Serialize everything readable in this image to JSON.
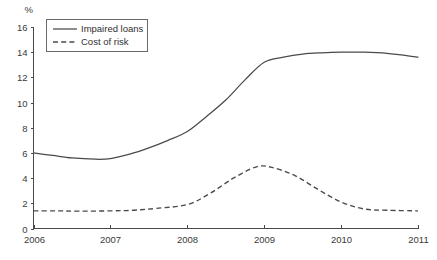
{
  "chart_data": {
    "type": "line",
    "title": "",
    "subtitle": "",
    "xlabel": "",
    "ylabel": "",
    "unit_label": "%",
    "grid": false,
    "legend_position": "top-left-inside",
    "xlim": [
      2006,
      2011
    ],
    "ylim": [
      0,
      16
    ],
    "x_ticks": [
      "2006",
      "2007",
      "2008",
      "2009",
      "2010",
      "2011"
    ],
    "y_ticks": [
      "0",
      "2",
      "4",
      "6",
      "8",
      "10",
      "12",
      "14",
      "16"
    ],
    "series": [
      {
        "name": "Impaired loans",
        "style": "solid",
        "color": "#4a4a4a",
        "x": [
          2006.0,
          2006.25,
          2006.5,
          2006.8,
          2007.0,
          2007.25,
          2007.5,
          2007.75,
          2008.0,
          2008.25,
          2008.5,
          2008.75,
          2009.0,
          2009.25,
          2009.5,
          2009.75,
          2010.0,
          2010.3,
          2010.6,
          2011.0
        ],
        "values": [
          6.0,
          5.8,
          5.6,
          5.5,
          5.55,
          5.9,
          6.4,
          7.0,
          7.7,
          8.9,
          10.2,
          11.8,
          13.2,
          13.6,
          13.85,
          13.95,
          14.0,
          14.0,
          13.9,
          13.6
        ]
      },
      {
        "name": "Cost of risk",
        "style": "dashed",
        "color": "#4a4a4a",
        "x": [
          2006.0,
          2006.3,
          2006.6,
          2007.0,
          2007.3,
          2007.6,
          2008.0,
          2008.3,
          2008.6,
          2008.9,
          2009.1,
          2009.4,
          2009.7,
          2010.0,
          2010.3,
          2010.6,
          2011.0
        ],
        "values": [
          1.4,
          1.4,
          1.38,
          1.4,
          1.45,
          1.6,
          1.9,
          2.8,
          4.0,
          4.9,
          4.85,
          4.2,
          3.1,
          2.1,
          1.55,
          1.45,
          1.4
        ]
      }
    ]
  },
  "legend": {
    "items": [
      {
        "label": "Impaired loans",
        "style": "solid"
      },
      {
        "label": "Cost of risk",
        "style": "dashed"
      }
    ]
  }
}
